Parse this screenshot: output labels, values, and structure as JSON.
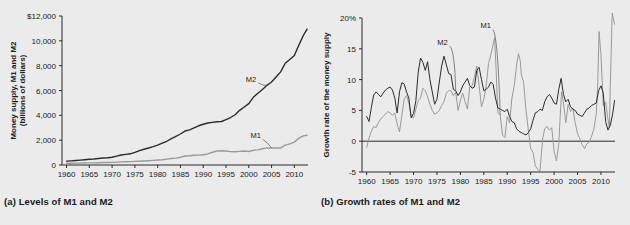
{
  "figure": {
    "background": "#ebebeb",
    "panels": [
      {
        "id": "a",
        "caption": "(a) Levels of M1 and M2"
      },
      {
        "id": "b",
        "caption": "(b) Growth rates of M1 and M2"
      }
    ]
  },
  "chart_data": [
    {
      "type": "line",
      "panel": "a",
      "title": "(a) Levels of M1 and M2",
      "xlabel": "",
      "ylabel": "Money supply, M1 and M2 (billions of dollars)",
      "ylabel_lines": [
        "Money supply, M1 and M2",
        "(billions of dollars)"
      ],
      "xlim": [
        1959,
        2013
      ],
      "ylim": [
        0,
        12000
      ],
      "xticks": [
        1960,
        1965,
        1970,
        1975,
        1980,
        1985,
        1990,
        1995,
        2000,
        2005,
        2010
      ],
      "xticklabels": [
        "1960",
        "1965",
        "1970",
        "1975",
        "1980",
        "1985",
        "1990",
        "1995",
        "2000",
        "2005",
        "2010"
      ],
      "yticks": [
        0,
        2000,
        4000,
        6000,
        8000,
        10000,
        12000
      ],
      "yticklabels": [
        "0",
        "2,000",
        "4,000",
        "6,000",
        "8,000",
        "10,000",
        "$12,000"
      ],
      "grid": false,
      "legend_position": "inline-annotation",
      "annotations": [
        {
          "text": "M2",
          "x": 2000.5,
          "y": 6700,
          "series": "M2"
        },
        {
          "text": "M1",
          "x": 2001.5,
          "y": 2150,
          "series": "M1"
        }
      ],
      "series": [
        {
          "name": "M2",
          "color": "#2b2b2b",
          "width": 1.4,
          "x": [
            1960,
            1961,
            1962,
            1963,
            1964,
            1965,
            1966,
            1967,
            1968,
            1969,
            1970,
            1971,
            1972,
            1973,
            1974,
            1975,
            1976,
            1977,
            1978,
            1979,
            1980,
            1981,
            1982,
            1983,
            1984,
            1985,
            1986,
            1987,
            1988,
            1989,
            1990,
            1991,
            1992,
            1993,
            1994,
            1995,
            1996,
            1997,
            1998,
            1999,
            2000,
            2001,
            2002,
            2003,
            2004,
            2005,
            2006,
            2007,
            2008,
            2009,
            2010,
            2011,
            2012,
            2012.8
          ],
          "values": [
            312,
            336,
            363,
            393,
            425,
            459,
            481,
            524,
            567,
            588,
            626,
            710,
            802,
            856,
            902,
            1016,
            1152,
            1270,
            1366,
            1474,
            1600,
            1756,
            1911,
            2127,
            2311,
            2497,
            2734,
            2832,
            2995,
            3159,
            3279,
            3379,
            3434,
            3487,
            3502,
            3649,
            3824,
            4046,
            4402,
            4676,
            4942,
            5448,
            5781,
            6077,
            6418,
            6683,
            7085,
            7500,
            8195,
            8500,
            8814,
            9666,
            10450,
            10950
          ]
        },
        {
          "name": "M1",
          "color": "#9a9a9a",
          "width": 1.4,
          "x": [
            1960,
            1961,
            1962,
            1963,
            1964,
            1965,
            1966,
            1967,
            1968,
            1969,
            1970,
            1971,
            1972,
            1973,
            1974,
            1975,
            1976,
            1977,
            1978,
            1979,
            1980,
            1981,
            1982,
            1983,
            1984,
            1985,
            1986,
            1987,
            1988,
            1989,
            1990,
            1991,
            1992,
            1993,
            1994,
            1995,
            1996,
            1997,
            1998,
            1999,
            2000,
            2001,
            2002,
            2003,
            2004,
            2005,
            2006,
            2007,
            2008,
            2009,
            2010,
            2011,
            2012,
            2012.8
          ],
          "values": [
            140,
            143,
            147,
            153,
            160,
            168,
            172,
            183,
            197,
            204,
            215,
            229,
            249,
            263,
            274,
            288,
            302,
            324,
            348,
            373,
            399,
            427,
            475,
            521,
            552,
            620,
            725,
            750,
            787,
            794,
            826,
            898,
            1025,
            1130,
            1150,
            1127,
            1081,
            1073,
            1095,
            1124,
            1088,
            1182,
            1220,
            1306,
            1376,
            1375,
            1367,
            1374,
            1606,
            1700,
            1840,
            2160,
            2350,
            2400
          ]
        }
      ]
    },
    {
      "type": "line",
      "panel": "b",
      "title": "(b) Growth rates of M1 and M2",
      "xlabel": "",
      "ylabel": "Growth rate of the money supply",
      "ylabel_lines": [
        "Growth rate of the money supply"
      ],
      "xlim": [
        1959,
        2013
      ],
      "ylim": [
        -5,
        20
      ],
      "xticks": [
        1960,
        1965,
        1970,
        1975,
        1980,
        1985,
        1990,
        1995,
        2000,
        2005,
        2010
      ],
      "xticklabels": [
        "1960",
        "1965",
        "1970",
        "1975",
        "1980",
        "1985",
        "1990",
        "1995",
        "2000",
        "2005",
        "2010"
      ],
      "yticks": [
        -5,
        0,
        5,
        10,
        15,
        20
      ],
      "yticklabels": [
        "-5",
        "0",
        "5",
        "10",
        "15",
        "20%"
      ],
      "grid": false,
      "zero_line": true,
      "legend_position": "inline-annotation",
      "annotations": [
        {
          "text": "M2",
          "x": 1976.2,
          "y": 15.6,
          "series": "M2"
        },
        {
          "text": "M1",
          "x": 1985.4,
          "y": 18.3,
          "series": "M1"
        }
      ],
      "series": [
        {
          "name": "M2",
          "color": "#2b2b2b",
          "width": 1.0,
          "x": [
            1960,
            1960.5,
            1961,
            1961.5,
            1962,
            1962.5,
            1963,
            1963.5,
            1964,
            1964.5,
            1965,
            1965.5,
            1966,
            1966.5,
            1967,
            1967.5,
            1968,
            1968.5,
            1969,
            1969.5,
            1970,
            1970.5,
            1971,
            1971.5,
            1972,
            1972.5,
            1973,
            1973.5,
            1974,
            1974.5,
            1975,
            1975.5,
            1976,
            1976.5,
            1977,
            1977.5,
            1978,
            1978.5,
            1979,
            1979.5,
            1980,
            1980.5,
            1981,
            1981.5,
            1982,
            1982.5,
            1983,
            1983.5,
            1984,
            1984.5,
            1985,
            1985.5,
            1986,
            1986.5,
            1987,
            1987.5,
            1988,
            1988.5,
            1989,
            1989.5,
            1990,
            1990.5,
            1991,
            1991.5,
            1992,
            1992.5,
            1993,
            1993.5,
            1994,
            1994.5,
            1995,
            1995.5,
            1996,
            1996.5,
            1997,
            1997.5,
            1998,
            1998.5,
            1999,
            1999.5,
            2000,
            2000.5,
            2001,
            2001.5,
            2002,
            2002.5,
            2003,
            2003.5,
            2004,
            2004.5,
            2005,
            2005.5,
            2006,
            2006.5,
            2007,
            2007.5,
            2008,
            2008.5,
            2009,
            2009.5,
            2010,
            2010.5,
            2011,
            2011.5,
            2012,
            2012.5,
            2012.9
          ],
          "values": [
            4.0,
            3.2,
            5.5,
            7.5,
            8.0,
            7.6,
            7.2,
            7.8,
            8.3,
            8.6,
            8.8,
            8.3,
            7.0,
            4.6,
            8.0,
            9.5,
            9.3,
            8.0,
            7.0,
            3.8,
            4.5,
            6.6,
            11.2,
            13.5,
            12.8,
            11.5,
            12.9,
            10.0,
            8.0,
            6.0,
            6.8,
            9.6,
            12.2,
            13.8,
            12.4,
            11.0,
            10.8,
            8.4,
            8.2,
            7.4,
            8.0,
            9.0,
            9.6,
            10.2,
            9.0,
            8.6,
            8.8,
            11.5,
            12.0,
            10.0,
            8.2,
            8.4,
            8.8,
            9.6,
            9.2,
            7.0,
            5.4,
            5.2,
            5.0,
            4.8,
            5.2,
            4.0,
            3.2,
            3.0,
            2.0,
            1.6,
            1.4,
            1.2,
            1.0,
            1.4,
            2.0,
            3.4,
            4.6,
            4.8,
            5.2,
            5.0,
            6.4,
            7.2,
            7.6,
            7.0,
            6.2,
            6.0,
            8.4,
            10.2,
            7.6,
            6.4,
            6.8,
            5.6,
            5.2,
            5.0,
            4.4,
            4.2,
            4.0,
            4.6,
            5.2,
            5.4,
            5.8,
            6.0,
            6.2,
            8.2,
            9.0,
            7.8,
            3.2,
            1.8,
            2.6,
            4.4,
            6.6,
            8.6,
            9.6,
            8.8,
            9.4
          ]
        },
        {
          "name": "M1",
          "color": "#9a9a9a",
          "width": 1.0,
          "x": [
            1960,
            1960.5,
            1961,
            1961.5,
            1962,
            1962.5,
            1963,
            1963.5,
            1964,
            1964.5,
            1965,
            1965.5,
            1966,
            1966.5,
            1967,
            1967.5,
            1968,
            1968.5,
            1969,
            1969.5,
            1970,
            1970.5,
            1971,
            1971.5,
            1972,
            1972.5,
            1973,
            1973.5,
            1974,
            1974.5,
            1975,
            1975.5,
            1976,
            1976.5,
            1977,
            1977.5,
            1978,
            1978.5,
            1979,
            1979.5,
            1980,
            1980.5,
            1981,
            1981.5,
            1982,
            1982.5,
            1983,
            1983.5,
            1984,
            1984.5,
            1985,
            1985.5,
            1986,
            1986.5,
            1987,
            1987.3,
            1987.6,
            1988,
            1988.5,
            1989,
            1989.5,
            1990,
            1990.5,
            1991,
            1991.5,
            1992,
            1992.4,
            1992.8,
            1993,
            1993.5,
            1994,
            1994.5,
            1995,
            1995.5,
            1996,
            1996.5,
            1997,
            1997.3,
            1997.6,
            1998,
            1998.5,
            1999,
            1999.5,
            2000,
            2000.5,
            2001,
            2001.3,
            2001.6,
            2002,
            2002.5,
            2003,
            2003.5,
            2004,
            2004.5,
            2005,
            2005.5,
            2006,
            2006.5,
            2007,
            2007.5,
            2008,
            2008.5,
            2009,
            2009.3,
            2009.6,
            2010,
            2010.5,
            2011,
            2011.4,
            2011.8,
            2012,
            2012.4,
            2012.9
          ],
          "values": [
            -1.0,
            0.5,
            1.6,
            2.4,
            2.2,
            3.0,
            3.6,
            4.0,
            4.4,
            4.8,
            4.6,
            4.2,
            4.6,
            2.8,
            1.5,
            4.2,
            6.8,
            7.4,
            6.2,
            4.0,
            3.8,
            5.2,
            6.6,
            7.0,
            8.6,
            8.2,
            7.2,
            6.0,
            5.0,
            4.4,
            4.6,
            5.0,
            5.8,
            6.4,
            7.8,
            8.2,
            8.2,
            7.4,
            8.0,
            5.0,
            6.6,
            7.8,
            6.4,
            5.2,
            8.8,
            9.0,
            10.4,
            12.2,
            9.0,
            5.6,
            6.8,
            9.0,
            12.6,
            14.0,
            15.8,
            16.8,
            12.0,
            4.6,
            4.2,
            1.0,
            0.6,
            4.0,
            3.0,
            7.0,
            9.0,
            12.4,
            14.2,
            13.0,
            10.8,
            9.6,
            5.0,
            1.8,
            -1.2,
            -1.8,
            -4.0,
            -4.6,
            -4.8,
            -2.0,
            0.6,
            2.0,
            2.4,
            1.8,
            2.2,
            -1.6,
            -3.2,
            -0.5,
            4.0,
            8.0,
            6.2,
            3.0,
            6.0,
            4.8,
            5.4,
            3.0,
            1.2,
            0.4,
            -0.6,
            -1.2,
            -0.4,
            -0.2,
            0.8,
            2.0,
            4.4,
            9.0,
            17.8,
            14.0,
            5.8,
            6.4,
            4.0,
            2.2,
            9.0,
            20.8,
            19.0,
            14.5,
            16.0
          ]
        }
      ]
    }
  ]
}
